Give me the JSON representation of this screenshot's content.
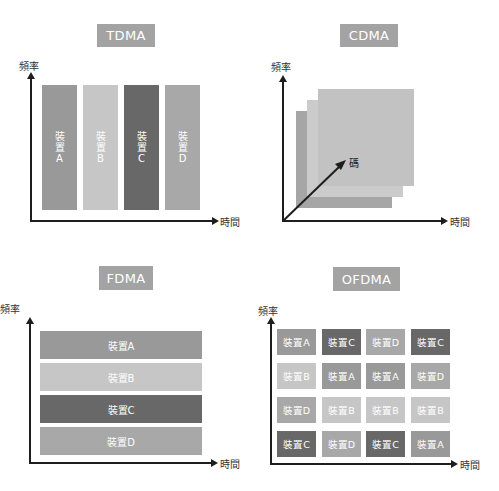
{
  "colors": {
    "title_bg": "#a3a3a3",
    "device_A": "#999999",
    "device_B": "#c6c6c6",
    "device_C": "#686868",
    "device_D": "#a8a8a8",
    "axis": "#1e1e1e"
  },
  "axis_labels": {
    "frequency": "頻率",
    "time": "時間",
    "code": "碼"
  },
  "panels": {
    "tdma": {
      "title": "TDMA",
      "bars": [
        {
          "device": "A",
          "l1": "裝",
          "l2": "置",
          "l3": "A"
        },
        {
          "device": "B",
          "l1": "裝",
          "l2": "置",
          "l3": "B"
        },
        {
          "device": "C",
          "l1": "裝",
          "l2": "置",
          "l3": "C"
        },
        {
          "device": "D",
          "l1": "裝",
          "l2": "置",
          "l3": "D"
        }
      ]
    },
    "cdma": {
      "title": "CDMA",
      "layers": [
        "back",
        "middle",
        "front"
      ]
    },
    "fdma": {
      "title": "FDMA",
      "bars": [
        {
          "device": "A",
          "label": "裝置A"
        },
        {
          "device": "B",
          "label": "裝置B"
        },
        {
          "device": "C",
          "label": "裝置C"
        },
        {
          "device": "D",
          "label": "裝置D"
        }
      ]
    },
    "ofdma": {
      "title": "OFDMA",
      "grid": [
        [
          {
            "device": "A",
            "label": "裝置A"
          },
          {
            "device": "C",
            "label": "裝置C"
          },
          {
            "device": "D",
            "label": "裝置D"
          },
          {
            "device": "C",
            "label": "裝置C"
          }
        ],
        [
          {
            "device": "B",
            "label": "裝置B"
          },
          {
            "device": "A",
            "label": "裝置A"
          },
          {
            "device": "A",
            "label": "裝置A"
          },
          {
            "device": "D",
            "label": "裝置D"
          }
        ],
        [
          {
            "device": "D",
            "label": "裝置D"
          },
          {
            "device": "B",
            "label": "裝置B"
          },
          {
            "device": "B",
            "label": "裝置B"
          },
          {
            "device": "B",
            "label": "裝置B"
          }
        ],
        [
          {
            "device": "C",
            "label": "裝置C"
          },
          {
            "device": "D",
            "label": "裝置D"
          },
          {
            "device": "C",
            "label": "裝置C"
          },
          {
            "device": "A",
            "label": "裝置A"
          }
        ]
      ]
    }
  }
}
